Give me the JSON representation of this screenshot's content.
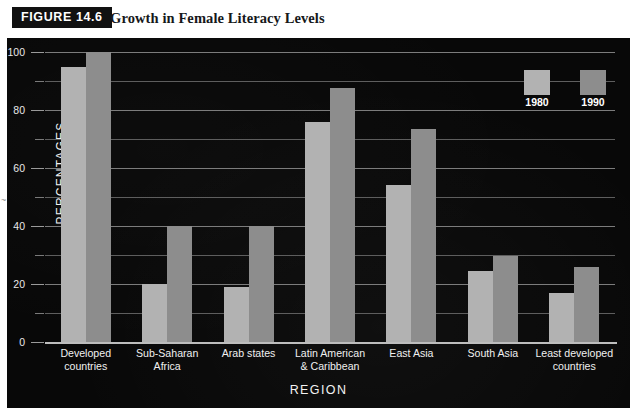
{
  "figure": {
    "tag": "FIGURE 14.6",
    "title": "Growth in Female Literacy Levels"
  },
  "chart_data": {
    "type": "bar",
    "title": "Growth in Female Literacy Levels",
    "xlabel": "REGION",
    "ylabel": "PERCENTAGES",
    "ylim": [
      0,
      100
    ],
    "yticks": [
      0,
      20,
      40,
      60,
      80,
      100
    ],
    "yticks_minor": [
      10,
      30,
      50,
      70,
      90
    ],
    "grid": true,
    "legend_position": "top-right",
    "categories": [
      "Developed countries",
      "Sub-Saharan Africa",
      "Arab states",
      "Latin American & Caribbean",
      "East Asia",
      "South Asia",
      "Least developed countries"
    ],
    "category_lines": [
      [
        "Developed",
        "countries"
      ],
      [
        "Sub-Saharan",
        "Africa"
      ],
      [
        "Arab states"
      ],
      [
        "Latin American",
        "& Caribbean"
      ],
      [
        "East Asia"
      ],
      [
        "South Asia"
      ],
      [
        "Least developed",
        "countries"
      ]
    ],
    "series": [
      {
        "name": "1980",
        "color": "#b2b2b2",
        "values": [
          95,
          20,
          19,
          76,
          54,
          24.5,
          17
        ]
      },
      {
        "name": "1990",
        "color": "#8d8d8d",
        "values": [
          100,
          40,
          40,
          87.5,
          73.5,
          29.5,
          26
        ]
      }
    ]
  },
  "legend": {
    "entries": [
      {
        "label": "1980",
        "color": "#b2b2b2"
      },
      {
        "label": "1990",
        "color": "#8d8d8d"
      }
    ]
  },
  "axes": {
    "y_title": "PERCENTAGES",
    "x_title": "REGION",
    "y_labels": [
      "0",
      "20",
      "40",
      "60",
      "80",
      "100"
    ]
  },
  "scan_artifact": "~"
}
